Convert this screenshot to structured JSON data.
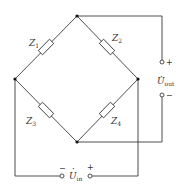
{
  "diagram": {
    "type": "bridge-circuit",
    "impedances": [
      {
        "id": "Z1",
        "label": "Z",
        "sub": "1",
        "branch": "top-left"
      },
      {
        "id": "Z2",
        "label": "Z",
        "sub": "2",
        "branch": "top-right"
      },
      {
        "id": "Z3",
        "label": "Z",
        "sub": "3",
        "branch": "bottom-left"
      },
      {
        "id": "Z4",
        "label": "Z",
        "sub": "4",
        "branch": "bottom-right"
      }
    ],
    "output": {
      "label": "U",
      "dot": "·",
      "sub": "out",
      "plus": "+",
      "minus": "−"
    },
    "input": {
      "label": "U",
      "dot": "·",
      "sub": "in",
      "plus": "+",
      "minus": "−"
    },
    "colors": {
      "wire": "#3a3a3a",
      "node": "#111111",
      "background": "#ffffff"
    }
  }
}
